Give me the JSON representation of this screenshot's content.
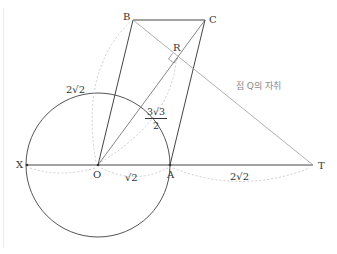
{
  "diagram": {
    "points": {
      "B": {
        "label": "B",
        "x": 133,
        "y": 20
      },
      "C": {
        "label": "C",
        "x": 205,
        "y": 20
      },
      "R": {
        "label": "R",
        "x": 178,
        "y": 58
      },
      "X": {
        "label": "X",
        "x": 27,
        "y": 165
      },
      "O": {
        "label": "O",
        "x": 98,
        "y": 165
      },
      "A": {
        "label": "A",
        "x": 170,
        "y": 165
      },
      "T": {
        "label": "T",
        "x": 313,
        "y": 165
      }
    },
    "measures": {
      "OB": "2√2",
      "OR_num": "3√3",
      "OR_den": "2",
      "OA": "√2",
      "AT": "2√2"
    },
    "annotation": "점 Q의 자취",
    "colors": {
      "line": "#444444",
      "locus": "#9a9a9a",
      "dashed": "#c8c8c8"
    }
  }
}
